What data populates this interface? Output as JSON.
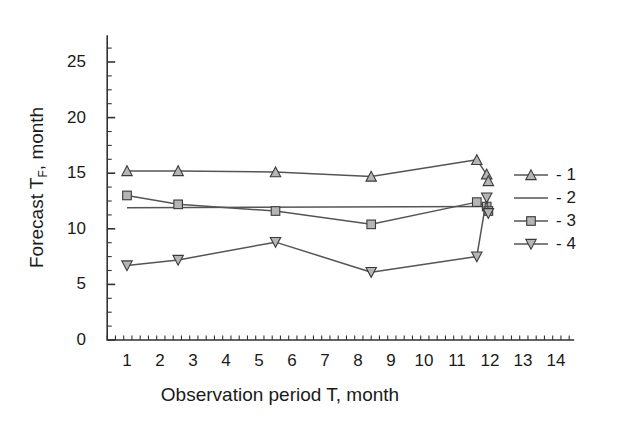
{
  "chart_data": {
    "type": "line",
    "title": "",
    "xlabel": "Observation period T, month",
    "ylabel_main": "Forecast T",
    "ylabel_sub": "F",
    "ylabel_tail": ", month",
    "xlim": [
      0,
      14.6
    ],
    "ylim": [
      0,
      27.5
    ],
    "xticks": [
      1,
      2,
      3,
      4,
      5,
      6,
      7,
      8,
      9,
      10,
      11,
      12,
      13,
      14
    ],
    "yticks": [
      0,
      5,
      10,
      15,
      20,
      25
    ],
    "xtick_labels": [
      "1",
      "2",
      "3",
      "4",
      "5",
      "6",
      "7",
      "8",
      "9",
      "10",
      "11",
      "12",
      "13",
      "14"
    ],
    "ytick_labels": [
      "0",
      "5",
      "10",
      "15",
      "20",
      "25"
    ],
    "minor_tick_interval_x": 0.25,
    "minor_tick_interval_y": 1.25,
    "grid": false,
    "legend_position": "right",
    "line_color": "#555555",
    "marker_fill": "#b5b5b5",
    "axis_color": "#333333",
    "series": [
      {
        "name": "1",
        "legend_label": "- 1",
        "marker": "triangle-up",
        "x": [
          1.0,
          2.55,
          5.5,
          8.4,
          11.6,
          11.9,
          11.95
        ],
        "y": [
          15.2,
          15.2,
          15.1,
          14.7,
          16.2,
          14.9,
          14.3
        ]
      },
      {
        "name": "2",
        "legend_label": "- 2",
        "marker": "none",
        "x": [
          1.0,
          11.95
        ],
        "y": [
          11.9,
          12.0
        ]
      },
      {
        "name": "3",
        "legend_label": "- 3",
        "marker": "square",
        "x": [
          1.0,
          2.55,
          5.5,
          8.4,
          11.6,
          11.9,
          11.95
        ],
        "y": [
          13.0,
          12.2,
          11.6,
          10.4,
          12.4,
          12.0,
          11.6
        ]
      },
      {
        "name": "4",
        "legend_label": "- 4",
        "marker": "triangle-down",
        "x": [
          1.0,
          2.55,
          5.5,
          8.4,
          11.6,
          11.9,
          11.95
        ],
        "y": [
          6.7,
          7.2,
          8.8,
          6.1,
          7.5,
          12.8,
          11.4
        ]
      }
    ]
  },
  "legend": {
    "items": [
      {
        "label": "- 1",
        "marker": "triangle-up"
      },
      {
        "label": "- 2",
        "marker": "line"
      },
      {
        "label": "- 3",
        "marker": "square"
      },
      {
        "label": "- 4",
        "marker": "triangle-down"
      }
    ]
  }
}
